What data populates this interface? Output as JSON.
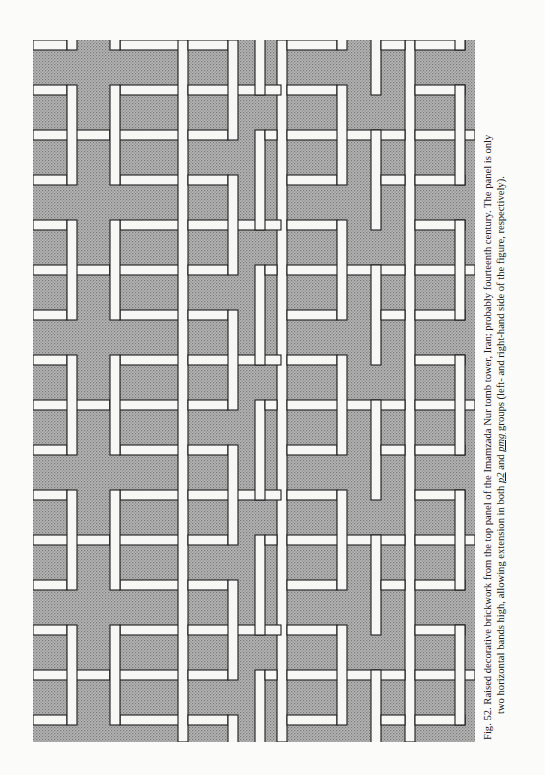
{
  "figure": {
    "label": "Fig. 52.",
    "colors": {
      "ground": "#a9a9a9",
      "bar": "#f7f7f5",
      "outline": "#1e1e1e"
    }
  },
  "caption": {
    "line1_lead": "Fig. 52. Raised decorative brickwork from the top panel of the Imamzada Nur tomb tower, Iran; probably fourteenth century. The panel is only",
    "line2_a": "two horizontal bands high, allowing extension in both ",
    "group1": "p2",
    "line2_b": " and ",
    "group2": "pmg",
    "line2_c": " groups (left- and right-hand side of the figure, respectively)."
  }
}
